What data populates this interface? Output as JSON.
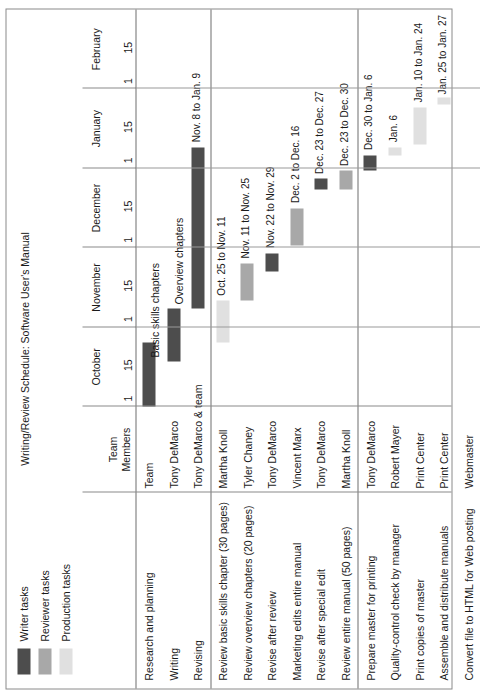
{
  "chart_data": {
    "type": "bar",
    "chart_kind": "gantt",
    "title": "Writing/Review Schedule: Software User's Manual",
    "xlabel": "",
    "ylabel": "",
    "grid": true,
    "legend_position": "top-left",
    "axis": {
      "months": [
        "October",
        "November",
        "December",
        "January",
        "February"
      ],
      "tick_labels": [
        "1",
        "15"
      ],
      "start": "Oct. 1",
      "end": "Feb. 15"
    },
    "legend": [
      {
        "label": "Writer tasks",
        "color": "#4d4d4d"
      },
      {
        "label": "Reviewer tasks",
        "color": "#a8a8a8"
      },
      {
        "label": "Production tasks",
        "color": "#e0e0e0"
      }
    ],
    "columns": [
      "",
      "Team Members"
    ],
    "groups": [
      {
        "category": "Writer tasks",
        "tasks": [
          {
            "task": "Research and planning",
            "member": "Team",
            "bar_label": "",
            "start": "Oct. 1",
            "end": "Oct. 25",
            "annotation": ""
          },
          {
            "task": "Writing",
            "member": "Tony DeMarco",
            "bar_label": "",
            "start": "Oct. 18",
            "end": "Nov. 8",
            "annotation": "Basic skills chapters"
          },
          {
            "task": "Revising",
            "member": "Tony DeMarco & team",
            "bar_label": "Nov. 8 to Jan. 9",
            "start": "Nov. 8",
            "end": "Jan. 9",
            "annotation": "Overview chapters"
          }
        ]
      },
      {
        "category": "Reviewer tasks",
        "tasks": [
          {
            "task": "Review basic skills chapter (30 pages)",
            "member": "Martha Knoll",
            "bar_label": "Oct. 25 to Nov. 11",
            "start": "Oct. 25",
            "end": "Nov. 11",
            "annotation": ""
          },
          {
            "task": "Review overview chapters (20 pages)",
            "member": "Tyler Chaney",
            "bar_label": "Nov. 11 to Nov. 25",
            "start": "Nov. 11",
            "end": "Nov. 25",
            "annotation": ""
          },
          {
            "task": "Revise after review",
            "member": "Tony DeMarco",
            "bar_label": "Nov. 22 to Nov. 29",
            "start": "Nov. 22",
            "end": "Nov. 29",
            "annotation": ""
          },
          {
            "task": "Marketing edits entire manual",
            "member": "Vincent Marx",
            "bar_label": "Dec. 2 to Dec. 16",
            "start": "Dec. 2",
            "end": "Dec. 16",
            "annotation": ""
          },
          {
            "task": "Revise after special edit",
            "member": "Tony DeMarco",
            "bar_label": "Dec. 23 to Dec. 27",
            "start": "Dec. 23",
            "end": "Dec. 27",
            "annotation": ""
          },
          {
            "task": "Review entire manual (50 pages)",
            "member": "Martha Knoll",
            "bar_label": "Dec. 23 to Dec. 30",
            "start": "Dec. 23",
            "end": "Dec. 30",
            "annotation": ""
          }
        ]
      },
      {
        "category": "Production tasks",
        "tasks": [
          {
            "task": "Prepare master for printing",
            "member": "Tony DeMarco",
            "bar_label": "Dec. 30 to Jan. 6",
            "start": "Dec. 30",
            "end": "Jan. 6",
            "annotation": ""
          },
          {
            "task": "Quality-control check by manager",
            "member": "Robert Mayer",
            "bar_label": "Jan. 6",
            "start": "Jan. 6",
            "end": "Jan. 8",
            "annotation": ""
          },
          {
            "task": "Print copies of master",
            "member": "Print Center",
            "bar_label": "Jan. 10 to Jan. 24",
            "start": "Jan. 10",
            "end": "Jan. 24",
            "annotation": ""
          },
          {
            "task": "Assemble and distribute manuals",
            "member": "Print Center",
            "bar_label": "Jan. 25 to Jan. 27",
            "start": "Jan. 25",
            "end": "Jan. 27",
            "annotation": ""
          },
          {
            "task": "Convert file to HTML for Web posting",
            "member": "Webmaster",
            "bar_label": "",
            "start": "",
            "end": "",
            "annotation": ""
          }
        ]
      }
    ]
  },
  "legend": {
    "items": [
      {
        "label": "Writer tasks"
      },
      {
        "label": "Reviewer tasks"
      },
      {
        "label": "Production tasks"
      }
    ]
  },
  "header": {
    "title": "Writing/Review Schedule: Software User's Manual",
    "members_column": "Team\nMembers",
    "members_column_line1": "Team",
    "members_column_line2": "Members"
  },
  "axis": {
    "months": [
      {
        "name": "October",
        "t1": "1",
        "t15": "15"
      },
      {
        "name": "November",
        "t1": "1",
        "t15": "15"
      },
      {
        "name": "December",
        "t1": "1",
        "t15": "15"
      },
      {
        "name": "January",
        "t1": "1",
        "t15": "15"
      },
      {
        "name": "February",
        "t1": "1",
        "t15": "15"
      }
    ]
  },
  "rows": [
    {
      "task": "Research and planning",
      "member": "Team",
      "bar_label": "",
      "annotation": ""
    },
    {
      "task": "Writing",
      "member": "Tony DeMarco",
      "bar_label": "",
      "annotation": "Basic skills chapters"
    },
    {
      "task": "Revising",
      "member": "Tony DeMarco & team",
      "bar_label": "Nov. 8 to Jan. 9",
      "annotation": "Overview chapters"
    },
    {
      "task": "Review basic skills chapter (30 pages)",
      "member": "Martha Knoll",
      "bar_label": "Oct. 25 to Nov. 11",
      "annotation": ""
    },
    {
      "task": "Review overview chapters (20 pages)",
      "member": "Tyler Chaney",
      "bar_label": "Nov. 11 to Nov. 25",
      "annotation": ""
    },
    {
      "task": "Revise after review",
      "member": "Tony DeMarco",
      "bar_label": "Nov. 22 to Nov. 29",
      "annotation": ""
    },
    {
      "task": "Marketing edits entire manual",
      "member": "Vincent Marx",
      "bar_label": "Dec. 2 to Dec. 16",
      "annotation": ""
    },
    {
      "task": "Revise after special edit",
      "member": "Tony DeMarco",
      "bar_label": "Dec. 23 to Dec. 27",
      "annotation": ""
    },
    {
      "task": "Review entire manual (50 pages)",
      "member": "Martha Knoll",
      "bar_label": "Dec. 23 to Dec. 30",
      "annotation": ""
    },
    {
      "task": "Prepare master for printing",
      "member": "Tony DeMarco",
      "bar_label": "Dec. 30 to Jan. 6",
      "annotation": ""
    },
    {
      "task": "Quality-control check by manager",
      "member": "Robert Mayer",
      "bar_label": "Jan. 6",
      "annotation": ""
    },
    {
      "task": "Print copies of master",
      "member": "Print Center",
      "bar_label": "Jan. 10 to Jan. 24",
      "annotation": ""
    },
    {
      "task": "Assemble and distribute manuals",
      "member": "Print Center",
      "bar_label": "Jan. 25 to Jan. 27",
      "annotation": ""
    },
    {
      "task": "Convert file to HTML for Web posting",
      "member": "Webmaster",
      "bar_label": "",
      "annotation": ""
    }
  ],
  "colors": {
    "writer": "#4d4d4d",
    "reviewer": "#a8a8a8",
    "production": "#e0e0e0",
    "border": "#8a8a8a",
    "rule": "#6e6e6e"
  }
}
